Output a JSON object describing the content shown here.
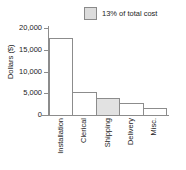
{
  "chart_data": {
    "type": "bar",
    "title": "",
    "xlabel": "",
    "ylabel": "Dollars ($)",
    "categories": [
      "Installation",
      "Clerical",
      "Shipping",
      "Delivery",
      "Misc."
    ],
    "values": [
      17800,
      5300,
      3900,
      2800,
      1600
    ],
    "ylim": [
      0,
      20000
    ],
    "yticks": [
      0,
      5000,
      10000,
      15000,
      20000
    ],
    "ytick_labels": [
      "0",
      "5,000",
      "10,000",
      "15,000",
      "20,000"
    ],
    "grid": false,
    "legend_position": "top-right",
    "highlight_category": "Shipping",
    "legend": [
      {
        "label": "13% of total cost",
        "swatch_color": "#dcdcdc",
        "swatch_border": "#8a8a8a"
      }
    ],
    "colors": {
      "bar_fill": "#ffffff",
      "bar_border": "#8c8c8c",
      "highlight_fill": "#e2e2e2",
      "axis": "#8c8c8c",
      "text": "#232323",
      "background": "#ffffff"
    }
  }
}
